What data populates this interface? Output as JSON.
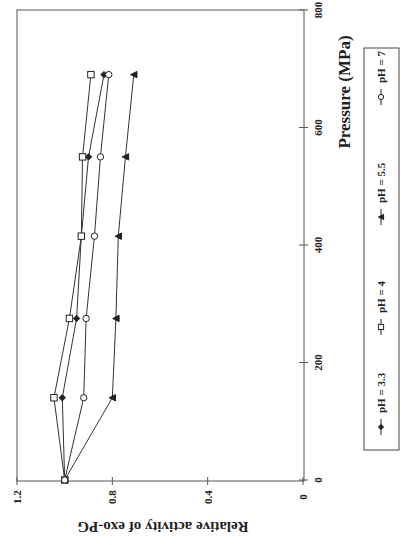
{
  "chart_data": {
    "type": "line",
    "orientation": "rotated -90deg on page (x-axis vertical on right, y-axis horizontal at bottom, reversed)",
    "title": "",
    "xlabel": "Pressure (MPa)",
    "ylabel": "Relative activity of exo-PG",
    "xlim": [
      0,
      800
    ],
    "ylim": [
      0,
      1.2
    ],
    "xticks": [
      0,
      200,
      400,
      600,
      800
    ],
    "xtick_labels": [
      "0",
      "200",
      "400",
      "600",
      "800"
    ],
    "yticks": [
      0,
      0.4,
      0.8,
      1.2
    ],
    "ytick_labels": [
      "0",
      "0.4",
      "0.8",
      "1.2"
    ],
    "grid": false,
    "legend_position": "right side, boxed, below x-axis label",
    "x": [
      0,
      140,
      275,
      415,
      550,
      690
    ],
    "series": [
      {
        "name": "pH = 3.3",
        "marker": "diamond-filled",
        "values": [
          1.0,
          1.01,
          0.95,
          0.93,
          0.9,
          0.835
        ]
      },
      {
        "name": "pH = 4",
        "marker": "square-open",
        "values": [
          1.0,
          1.045,
          0.98,
          0.93,
          0.925,
          0.89
        ]
      },
      {
        "name": "pH = 5.5",
        "marker": "triangle-filled",
        "values": [
          1.0,
          0.8,
          0.785,
          0.775,
          0.745,
          0.71
        ]
      },
      {
        "name": "pH = 7",
        "marker": "circle-open",
        "values": [
          1.0,
          0.92,
          0.91,
          0.875,
          0.85,
          0.815
        ]
      }
    ]
  },
  "legend": {
    "items": [
      {
        "label": "pH = 3.3",
        "marker": "diamond-filled"
      },
      {
        "label": "pH = 4",
        "marker": "square-open"
      },
      {
        "label": "pH = 5.5",
        "marker": "triangle-filled"
      },
      {
        "label": "pH = 7",
        "marker": "circle-open"
      }
    ]
  },
  "colors": {
    "line": "#333333",
    "axis": "#444444",
    "text": "#222222"
  }
}
